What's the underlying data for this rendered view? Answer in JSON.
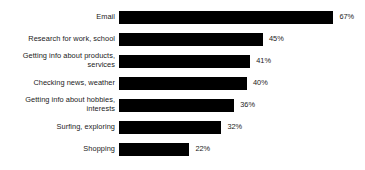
{
  "chart_data": {
    "type": "bar",
    "orientation": "horizontal",
    "title": "",
    "subtitle": "",
    "xlabel": "",
    "ylabel": "",
    "xlim": [
      0,
      75
    ],
    "grid": false,
    "legend": false,
    "value_suffix": "%",
    "categories": [
      "Email",
      "Research for work, school",
      "Getting info about products,\nservices",
      "Checking news, weather",
      "Getting info about hobbies,\ninterests",
      "Surfing, exploring",
      "Shopping"
    ],
    "values": [
      67,
      45,
      41,
      40,
      36,
      32,
      22
    ],
    "value_labels": [
      "67%",
      "45%",
      "41%",
      "40%",
      "36%",
      "32%",
      "22%"
    ],
    "bar_color": "#000000",
    "text_color": "#1a1a1a",
    "background_color": "#ffffff"
  }
}
